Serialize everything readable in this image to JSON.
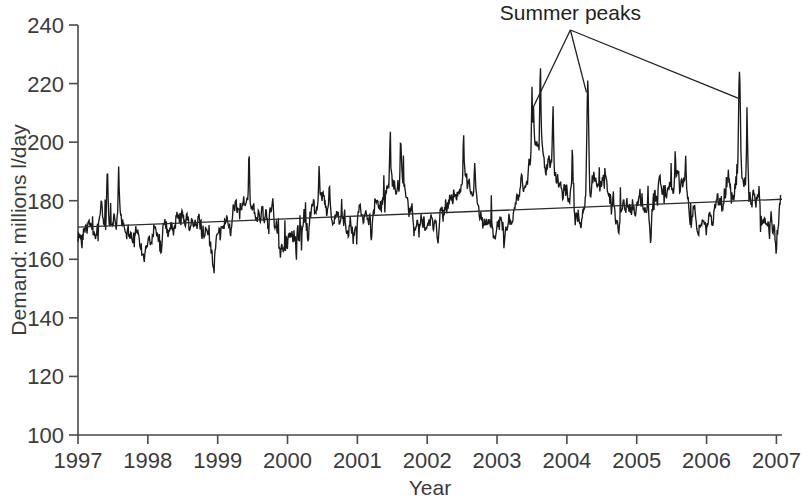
{
  "chart_data": {
    "type": "line",
    "title": "",
    "xlabel": "Year",
    "ylabel": "Demand: millions l/day",
    "xlim": [
      1997,
      2007.08
    ],
    "ylim": [
      100,
      240
    ],
    "ytick_step": 20,
    "grid": false,
    "legend": null,
    "x_tick_labels": [
      "1997",
      "1998",
      "1999",
      "2000",
      "2001",
      "2002",
      "2003",
      "2004",
      "2005",
      "2006",
      "2007"
    ],
    "y_tick_labels": [
      "100",
      "120",
      "140",
      "160",
      "180",
      "200",
      "220",
      "240"
    ],
    "annotations": [
      {
        "text": "Summer peaks",
        "anchor_x": 2004.05,
        "anchor_y": 242,
        "points_to": [
          {
            "x": 2003.52,
            "y": 212
          },
          {
            "x": 2004.28,
            "y": 217
          },
          {
            "x": 2006.45,
            "y": 215
          }
        ]
      }
    ],
    "series": [
      {
        "name": "Demand",
        "style": "noisy-daily",
        "description": "Daily water demand, millions litres per day, 1997-2007",
        "seed": 20041,
        "baseline_start": 171,
        "baseline_end": 180,
        "noise_sd": 4.6,
        "summer_amplitude": 9.5,
        "seasonal_growth": 1.9,
        "spikes": [
          {
            "x": 1997.08,
            "y": 182
          },
          {
            "x": 1997.42,
            "y": 196
          },
          {
            "x": 1997.58,
            "y": 198
          },
          {
            "x": 1998.55,
            "y": 180
          },
          {
            "x": 1999.45,
            "y": 197
          },
          {
            "x": 2000.45,
            "y": 189
          },
          {
            "x": 2000.6,
            "y": 188
          },
          {
            "x": 2001.47,
            "y": 203
          },
          {
            "x": 2001.62,
            "y": 200
          },
          {
            "x": 2002.52,
            "y": 192
          },
          {
            "x": 2002.68,
            "y": 190
          },
          {
            "x": 2003.5,
            "y": 210
          },
          {
            "x": 2003.62,
            "y": 208
          },
          {
            "x": 2003.8,
            "y": 201
          },
          {
            "x": 2004.08,
            "y": 197
          },
          {
            "x": 2004.3,
            "y": 221
          },
          {
            "x": 2005.55,
            "y": 190
          },
          {
            "x": 2005.7,
            "y": 187
          },
          {
            "x": 2006.47,
            "y": 224
          },
          {
            "x": 2006.58,
            "y": 212
          }
        ],
        "troughs": [
          {
            "x": 1998.2,
            "y": 163
          },
          {
            "x": 1998.95,
            "y": 159
          },
          {
            "x": 1999.9,
            "y": 158
          },
          {
            "x": 2000.3,
            "y": 160
          },
          {
            "x": 2001.2,
            "y": 161
          },
          {
            "x": 2002.15,
            "y": 160
          },
          {
            "x": 2003.1,
            "y": 162
          },
          {
            "x": 2004.75,
            "y": 166
          },
          {
            "x": 2005.2,
            "y": 159
          },
          {
            "x": 2006.9,
            "y": 160
          },
          {
            "x": 2007.0,
            "y": 157
          }
        ],
        "summer_peak_values": [
          212,
          221,
          224
        ],
        "summer_peak_years": [
          2003.52,
          2004.3,
          2006.47
        ]
      },
      {
        "name": "Linear trend",
        "style": "straight",
        "start": {
          "x": 1997.0,
          "y": 171.0
        },
        "end": {
          "x": 2007.08,
          "y": 180.5
        }
      }
    ]
  },
  "axes": {
    "x_title": "Year",
    "y_title": "Demand: millions l/day"
  }
}
